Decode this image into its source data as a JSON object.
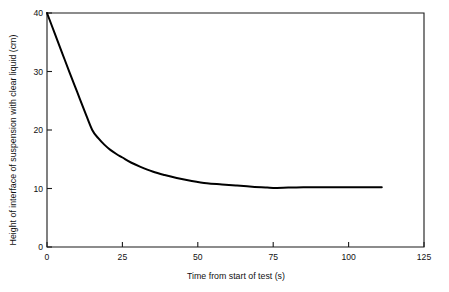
{
  "chart_data": {
    "type": "line",
    "title": "",
    "subtitle": "",
    "xlabel": "Time from start of test (s)",
    "ylabel": "Height of interface of suspension with clear liquid (cm)",
    "xlim": [
      0,
      125
    ],
    "ylim": [
      0,
      40
    ],
    "xticks": [
      0,
      25,
      50,
      75,
      100,
      125
    ],
    "xtick_labels": [
      "0",
      "25",
      "50",
      "75",
      "100",
      "125"
    ],
    "yticks": [
      0,
      10,
      20,
      30,
      40
    ],
    "ytick_labels": [
      "0",
      "10",
      "20",
      "30",
      "40"
    ],
    "grid": false,
    "legend": false,
    "legend_position": "none",
    "series": [
      {
        "name": "Interface height",
        "color": "#000000",
        "x": [
          0,
          2.5,
          5,
          7.5,
          10,
          12.5,
          15,
          17,
          19,
          21,
          23,
          25,
          28,
          31,
          35,
          39,
          43,
          48,
          53,
          58,
          63,
          68,
          73,
          75,
          80,
          85,
          90,
          95,
          100,
          105,
          111
        ],
        "y": [
          40.0,
          36.6,
          33.2,
          29.8,
          26.5,
          23.2,
          20.0,
          18.6,
          17.5,
          16.6,
          15.9,
          15.3,
          14.4,
          13.7,
          12.9,
          12.3,
          11.8,
          11.3,
          10.9,
          10.7,
          10.5,
          10.3,
          10.15,
          10.1,
          10.15,
          10.2,
          10.2,
          10.2,
          10.2,
          10.2,
          10.2
        ]
      }
    ],
    "annotations": []
  },
  "figure": {
    "background_color": "#ffffff",
    "axis_color": "#1a1a1a",
    "line_color": "#000000"
  }
}
